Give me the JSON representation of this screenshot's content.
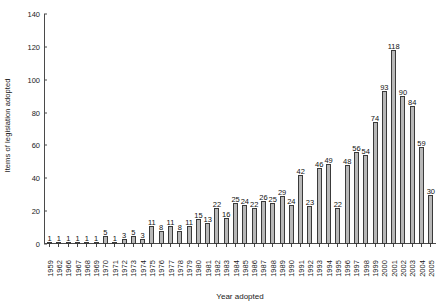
{
  "chart_data": {
    "type": "bar",
    "title": "",
    "xlabel": "Year adopted",
    "ylabel": "Items of legislation adopted",
    "ylim": [
      0,
      140
    ],
    "yticks": [
      0,
      20,
      40,
      60,
      80,
      100,
      120,
      140
    ],
    "grid": false,
    "legend": null,
    "bar_color": "#b8b8b8",
    "bar_edge_color": "#3a3a3a",
    "show_value_labels": true,
    "categories": [
      "1959",
      "1962",
      "1966",
      "1967",
      "1968",
      "1969",
      "1970",
      "1971",
      "1972",
      "1973",
      "1974",
      "1975",
      "1976",
      "1977",
      "1978",
      "1979",
      "1980",
      "1981",
      "1982",
      "1983",
      "1984",
      "1985",
      "1986",
      "1987",
      "1988",
      "1989",
      "1990",
      "1991",
      "1992",
      "1993",
      "1994",
      "1995",
      "1996",
      "1997",
      "1998",
      "1999",
      "2000",
      "2001",
      "2002",
      "2003",
      "2004",
      "2005"
    ],
    "values": [
      1,
      1,
      1,
      1,
      1,
      1,
      5,
      1,
      3,
      5,
      3,
      11,
      8,
      11,
      8,
      11,
      15,
      13,
      22,
      16,
      25,
      24,
      22,
      26,
      25,
      29,
      24,
      42,
      23,
      46,
      49,
      22,
      48,
      56,
      54,
      74,
      93,
      118,
      90,
      84,
      59,
      30
    ]
  }
}
